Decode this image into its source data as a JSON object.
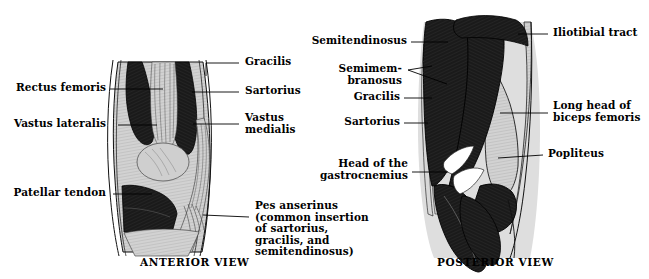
{
  "figure": {
    "colors": {
      "muscle_dark": "#1a1a1a",
      "tissue_light": "#d2d2d2",
      "outline": "#000000",
      "background": "#ffffff",
      "text": "#000000"
    }
  },
  "anterior": {
    "caption": "ANTERIOR VIEW",
    "labels_left": [
      {
        "text": "Rectus femoris"
      },
      {
        "text": "Vastus lateralis"
      },
      {
        "text": "Patellar tendon"
      }
    ],
    "labels_right": [
      {
        "text": "Gracilis"
      },
      {
        "text": "Sartorius"
      },
      {
        "text": "Vastus\nmedialis"
      },
      {
        "text": "Pes anserinus\n(common insertion\nof sartorius,\ngracilis, and\nsemitendinosus)"
      }
    ]
  },
  "posterior": {
    "caption": "POSTERIOR VIEW",
    "labels_left": [
      {
        "text": "Semitendinosus"
      },
      {
        "text": "Semimem-\nbranosus"
      },
      {
        "text": "Gracilis"
      },
      {
        "text": "Sartorius"
      },
      {
        "text": "Head of the\ngastrocnemius"
      }
    ],
    "labels_right": [
      {
        "text": "Iliotibial tract"
      },
      {
        "text": "Long head of\nbiceps femoris"
      },
      {
        "text": "Popliteus"
      }
    ]
  }
}
